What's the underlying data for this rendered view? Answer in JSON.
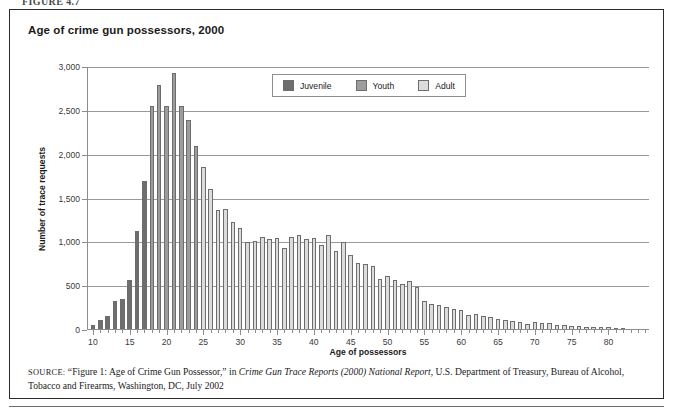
{
  "figure": {
    "caption_strip": "FIGURE 4.7",
    "title": "Age of crime gun possessors, 2000"
  },
  "legend": {
    "items": [
      {
        "label": "Juvenile",
        "color": "#6e6e6e"
      },
      {
        "label": "Youth",
        "color": "#9d9d9d"
      },
      {
        "label": "Adult",
        "color": "#dcdcdc"
      }
    ]
  },
  "source": {
    "label": "SOURCE:",
    "part1": " “Figure 1: Age of Crime Gun Possessor,” in ",
    "italic": "Crime Gun Trace Reports (2000) National Report",
    "part2": ", U.S. Department of Treasury, Bureau of Alcohol, Tobacco and Firearms, Washington, DC, July 2002"
  },
  "chart_data": {
    "type": "bar",
    "title": "Age of crime gun possessors, 2000",
    "xlabel": "Age of possessors",
    "ylabel": "Number of trace requests",
    "xlim": [
      9.2,
      85.5
    ],
    "ylim": [
      0,
      3000
    ],
    "ytick_values": [
      0,
      500,
      1000,
      1500,
      2000,
      2500,
      3000
    ],
    "ytick_labels": [
      "0",
      "500",
      "1,000",
      "1,500",
      "2,000",
      "2,500",
      "3,000"
    ],
    "xtick_values": [
      10,
      15,
      20,
      25,
      30,
      35,
      40,
      45,
      50,
      55,
      60,
      65,
      70,
      75,
      80
    ],
    "xtick_labels": [
      "10",
      "15",
      "20",
      "25",
      "30",
      "35",
      "40",
      "45",
      "50",
      "55",
      "60",
      "65",
      "70",
      "75",
      "80"
    ],
    "grid": "horizontal",
    "legend_position": "upper-center",
    "categories": [
      10,
      11,
      12,
      13,
      14,
      15,
      16,
      17,
      18,
      19,
      20,
      21,
      22,
      23,
      24,
      25,
      26,
      27,
      28,
      29,
      30,
      31,
      32,
      33,
      34,
      35,
      36,
      37,
      38,
      39,
      40,
      41,
      42,
      43,
      44,
      45,
      46,
      47,
      48,
      49,
      50,
      51,
      52,
      53,
      54,
      55,
      56,
      57,
      58,
      59,
      60,
      61,
      62,
      63,
      64,
      65,
      66,
      67,
      68,
      69,
      70,
      71,
      72,
      73,
      74,
      75,
      76,
      77,
      78,
      79,
      80,
      81,
      82
    ],
    "values": [
      60,
      110,
      160,
      330,
      350,
      570,
      1130,
      1700,
      2560,
      2790,
      2550,
      2930,
      2560,
      2400,
      2100,
      1860,
      1610,
      1370,
      1380,
      1230,
      1160,
      1000,
      1010,
      1060,
      1040,
      1050,
      940,
      1060,
      1080,
      1040,
      1050,
      970,
      1080,
      900,
      1000,
      860,
      760,
      750,
      730,
      580,
      620,
      570,
      530,
      560,
      490,
      330,
      300,
      290,
      260,
      240,
      230,
      170,
      180,
      160,
      150,
      130,
      110,
      100,
      90,
      70,
      90,
      80,
      80,
      60,
      60,
      50,
      50,
      40,
      40,
      30,
      30,
      20,
      10
    ],
    "series_groups": [
      {
        "name": "Juvenile",
        "age_range": [
          10,
          17
        ],
        "color": "#6e6e6e"
      },
      {
        "name": "Youth",
        "age_range": [
          18,
          24
        ],
        "color": "#9d9d9d"
      },
      {
        "name": "Adult",
        "age_range": [
          25,
          82
        ],
        "color": "#dcdcdc"
      }
    ]
  }
}
